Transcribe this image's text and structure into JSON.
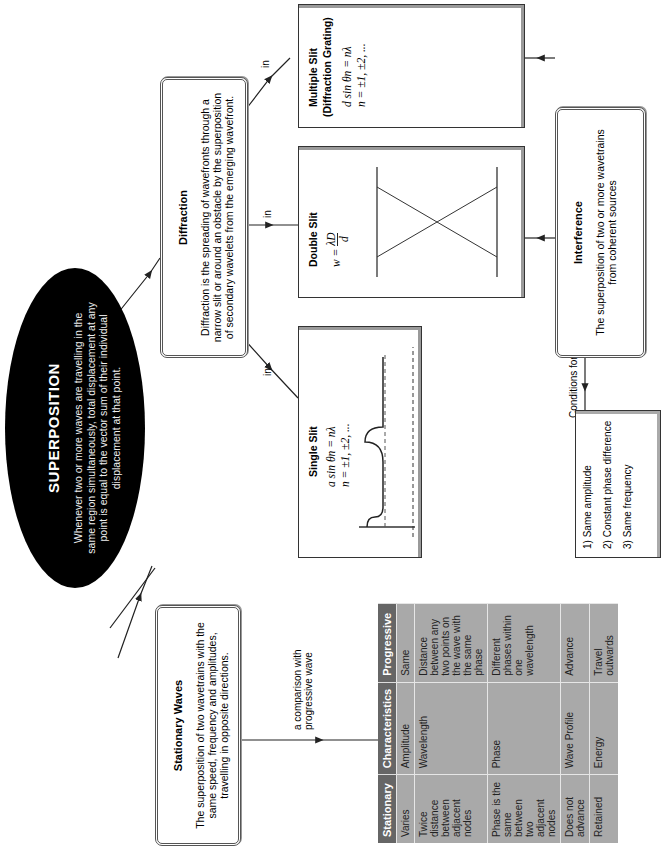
{
  "superposition": {
    "title": "SUPERPOSITION",
    "description": "Whenever two or more waves are travelling in the same region simultaneously, total displacement at any point is equal to the vector sum of their individual displacement at that point."
  },
  "stationary": {
    "title": "Stationary Waves",
    "description": "The superposition of two wavetrains with the same speed, frequency and amplitudes, travelling in opposite directions."
  },
  "diffraction": {
    "title": "Diffraction",
    "description": "Diffraction is the spreading of wavefronts through a narrow slit or around an obstacle by the superposition of secondary wavelets from the emerging wavefront."
  },
  "interference": {
    "title": "Interference",
    "description": "The superposition of two or more wavetrains from coherent sources"
  },
  "single_slit": {
    "title": "Single Slit",
    "eq1": "a sin θn = nλ",
    "eq2": "n = ±1, ±2, ...",
    "label_a": "a",
    "label_theta": "θ"
  },
  "double_slit": {
    "title": "Double Slit",
    "eq": "w = λD / d",
    "eq_lhs": "w =",
    "eq_num": "λD",
    "eq_den": "d",
    "max_label": "max",
    "label_d": "d",
    "label_D": "D"
  },
  "multiple_slit": {
    "title": "Multiple Slit",
    "subtitle": "(Diffraction Grating)",
    "eq1": "d sin θn = nλ",
    "eq2": "n = ±1, ±2, ...",
    "label_m": "m",
    "label_d": "d",
    "label_theta": "θ"
  },
  "edges": {
    "in": "in",
    "comparison": "a comparison with progressive wave",
    "comparison_line1": "a comparison with",
    "comparison_line2": "progressive wave",
    "conditions": "Conditions for Interference"
  },
  "conditions": {
    "items": [
      "1) Same amplitude",
      "2) Constant phase difference",
      "3) Same frequency"
    ]
  },
  "comparison_table": {
    "headers": [
      "Stationary",
      "Characteristics",
      "Progressive"
    ],
    "rows": [
      [
        "Varies",
        "Amplitude",
        "Same"
      ],
      [
        "Twice distance between adjacent nodes",
        "Wavelength",
        "Distance between any two points on the wave with the same phase"
      ],
      [
        "Phase is the same between two adjacent nodes",
        "Phase",
        "Different phases within one wavelength"
      ],
      [
        "Does not advance",
        "Wave Profile",
        "Advance"
      ],
      [
        "Retained",
        "Energy",
        "Travel outwards"
      ]
    ]
  }
}
